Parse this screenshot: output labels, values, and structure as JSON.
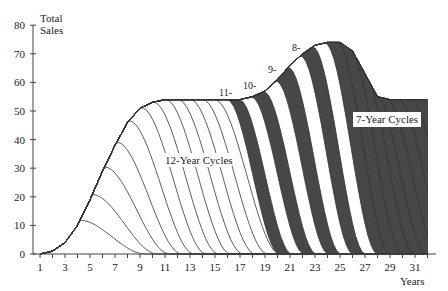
{
  "chart_data": {
    "type": "area",
    "title": "",
    "ylabel": "Total Sales",
    "xlabel": "Years",
    "ylim": [
      0,
      80
    ],
    "xlim": [
      1,
      32
    ],
    "y_ticks": [
      0,
      10,
      20,
      30,
      40,
      50,
      60,
      70,
      80
    ],
    "x_tick_labels": [
      1,
      3,
      5,
      7,
      9,
      11,
      13,
      15,
      17,
      19,
      21,
      23,
      25,
      27,
      29,
      31
    ],
    "grid": false,
    "legend": "none",
    "annotations": [
      {
        "text": "12-Year Cycles",
        "x": 11.3,
        "y": 32
      },
      {
        "text": "7-Year Cycles",
        "x": 27.1,
        "y": 47
      },
      {
        "text": "11-",
        "x": 15.6,
        "y": 56
      },
      {
        "text": "10-",
        "x": 17.6,
        "y": 58
      },
      {
        "text": "9-",
        "x": 19.6,
        "y": 64
      },
      {
        "text": "8-",
        "x": 21.5,
        "y": 72
      }
    ],
    "series": [
      {
        "name": "Total Sales (envelope)",
        "x": [
          1,
          2,
          3,
          4,
          5,
          6,
          7,
          8,
          9,
          10,
          11,
          12,
          13,
          14,
          15,
          16,
          17,
          18,
          19,
          20,
          21,
          22,
          23,
          24,
          25,
          26,
          27,
          28,
          29,
          30,
          31,
          32
        ],
        "values": [
          0,
          1,
          4,
          10,
          19,
          29,
          38,
          46,
          51,
          53,
          54,
          54,
          54,
          54,
          54,
          54,
          54,
          55,
          57,
          61,
          66,
          70,
          73,
          74,
          74,
          71,
          63,
          55,
          54,
          54,
          54,
          54
        ]
      }
    ],
    "cycle_phases": [
      {
        "label": "12-Year Cycles",
        "start_year": 1,
        "end_year": 16
      },
      {
        "label": "11-Year Cycle",
        "marker_year": 17
      },
      {
        "label": "10-Year Cycle",
        "marker_year": 19
      },
      {
        "label": "9-Year Cycle",
        "marker_year": 21
      },
      {
        "label": "8-Year Cycle",
        "marker_year": 22
      },
      {
        "label": "7-Year Cycles",
        "start_year": 24,
        "end_year": 32
      }
    ]
  },
  "axis": {
    "y_title_line1": "Total",
    "y_title_line2": "Sales",
    "x_title": "Years"
  },
  "labels": {
    "twelve": "12-Year Cycles",
    "seven": "7-Year Cycles",
    "l11": "11-",
    "l10": "10-",
    "l9": "9-",
    "l8": "8-"
  },
  "colors": {
    "dark_band": "#474747",
    "line": "#333333",
    "axis": "#444444",
    "background": "#ffffff"
  }
}
